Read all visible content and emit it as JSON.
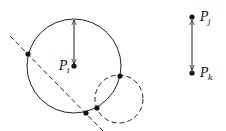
{
  "diagram": {
    "labels": {
      "pi": {
        "base": "P",
        "sub": "i"
      },
      "pj": {
        "base": "P",
        "sub": "j"
      },
      "pk": {
        "base": "P",
        "sub": "k"
      }
    },
    "colors": {
      "stroke": "#222222",
      "point": "#111111",
      "background": "#ffffff"
    },
    "main_circle": {
      "cx": 74,
      "cy": 66,
      "r": 47,
      "style": "solid"
    },
    "dashed_circle": {
      "cx": 119,
      "cy": 99,
      "r": 24,
      "style": "dashed"
    },
    "dashed_line": {
      "x1": 10,
      "y1": 36,
      "x2": 103,
      "y2": 131
    },
    "points": [
      {
        "x": 28,
        "y": 54
      },
      {
        "x": 74,
        "y": 66,
        "label": "P_i"
      },
      {
        "x": 120,
        "y": 76
      },
      {
        "x": 97,
        "y": 108
      },
      {
        "x": 86,
        "y": 113
      },
      {
        "x": 192,
        "y": 17,
        "label": "P_j"
      },
      {
        "x": 192,
        "y": 73,
        "label": "P_k"
      }
    ],
    "arrows": [
      {
        "from": "P_i",
        "to": "circle-top",
        "double_headed": true
      },
      {
        "from": "P_j",
        "to": "P_k",
        "double_headed": true
      }
    ]
  }
}
